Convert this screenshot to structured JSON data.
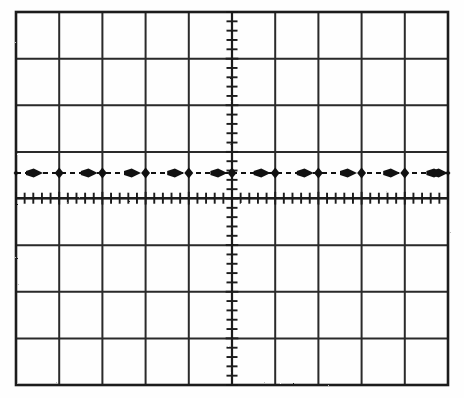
{
  "figure": {
    "kind": "oscilloscope-graticule",
    "caption": "",
    "background_color": "#fefefe",
    "ink_color": "#1a1a1a"
  },
  "graticule": {
    "left": 16,
    "top": 12,
    "right": 448,
    "bottom": 385,
    "horizontal_divisions": 10,
    "vertical_divisions": 8,
    "division_width": 43.2,
    "division_height": 46.6,
    "subdivisions_per_division": 5,
    "border_color": "#1a1a1a",
    "border_width": 2.6,
    "grid_line_color": "#2a2a2a",
    "grid_line_width": 2.0,
    "center_x": 232,
    "center_y": 198.2,
    "minor_tick_length": 11,
    "minor_tick_width": 1.9,
    "minor_tick_color": "#1a1a1a"
  },
  "trace": {
    "label": "flat-horizontal-trace",
    "y_position": 173,
    "y_divisions_above_center": 0.54,
    "color": "#111111",
    "line_width": 2.2,
    "line_style": "dashed",
    "dash_pattern": "5 4",
    "start_x": 16,
    "end_x": 448,
    "marker_dot_shape": "diamond",
    "marker_dot_radius": 5.6,
    "marker_dot_count": 11,
    "marker_dot_x_positions": [
      16,
      59.2,
      102.4,
      145.6,
      188.8,
      232,
      275.2,
      318.4,
      361.6,
      404.8,
      448
    ],
    "arrow_shape": "right-arrowhead",
    "arrow_count": 11,
    "arrow_direction": "right",
    "arrow_length": 17,
    "arrow_half_height": 4.6,
    "arrow_x_positions": [
      26,
      80.8,
      124,
      167.2,
      210.4,
      253.6,
      296.8,
      340,
      383.2,
      426.4,
      444
    ]
  },
  "chart_data": {
    "type": "line",
    "title": "",
    "xlabel": "",
    "ylabel": "",
    "xlim": [
      -5,
      5
    ],
    "ylim": [
      -4,
      4
    ],
    "grid": true,
    "legend": "none",
    "x_tick_labels": [],
    "y_tick_labels": [],
    "series": [
      {
        "name": "trace",
        "x": [
          -5,
          -4,
          -3,
          -2,
          -1,
          0,
          1,
          2,
          3,
          4,
          5
        ],
        "values": [
          0.54,
          0.54,
          0.54,
          0.54,
          0.54,
          0.54,
          0.54,
          0.54,
          0.54,
          0.54,
          0.54
        ]
      }
    ]
  }
}
